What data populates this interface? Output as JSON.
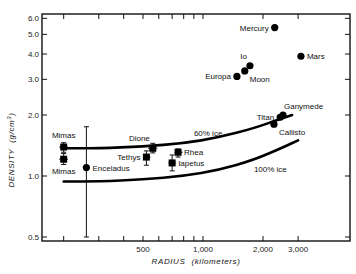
{
  "chart_data": {
    "type": "scatter",
    "title": "",
    "xlabel": "RADIUS (kilometers)",
    "ylabel": "DENSITY (g/cm³)",
    "xscale": "log",
    "yscale": "log",
    "xlim": [
      140,
      4500
    ],
    "ylim": [
      0.48,
      6.6
    ],
    "x_ticks": [
      {
        "value": 200,
        "label": ""
      },
      {
        "value": 300,
        "label": ""
      },
      {
        "value": 400,
        "label": ""
      },
      {
        "value": 500,
        "label": "500"
      },
      {
        "value": 600,
        "label": ""
      },
      {
        "value": 700,
        "label": ""
      },
      {
        "value": 800,
        "label": ""
      },
      {
        "value": 900,
        "label": ""
      },
      {
        "value": 1000,
        "label": "1,000"
      },
      {
        "value": 2000,
        "label": "2,000"
      },
      {
        "value": 3000,
        "label": "3,000"
      }
    ],
    "y_ticks": [
      {
        "value": 0.5,
        "label": "0.5"
      },
      {
        "value": 1.0,
        "label": "1.0"
      },
      {
        "value": 2.0,
        "label": "2.0"
      },
      {
        "value": 3.0,
        "label": "3.0"
      },
      {
        "value": 4.0,
        "label": "4.0"
      },
      {
        "value": 5.0,
        "label": "5.0"
      },
      {
        "value": 6.0,
        "label": "6.0"
      }
    ],
    "grid": false,
    "points": [
      {
        "name": "Mercury",
        "x": 2290,
        "y": 5.4,
        "marker": "circle",
        "label_side": "left"
      },
      {
        "name": "Mars",
        "x": 3100,
        "y": 3.9,
        "marker": "circle",
        "label_side": "right"
      },
      {
        "name": "Io",
        "x": 1720,
        "y": 3.5,
        "marker": "circle",
        "label_side": "above-left"
      },
      {
        "name": "Moon",
        "x": 1620,
        "y": 3.3,
        "marker": "circle",
        "label_side": "below-right"
      },
      {
        "name": "Europa",
        "x": 1480,
        "y": 3.1,
        "marker": "circle",
        "label_side": "left"
      },
      {
        "name": "Ganymede",
        "x": 2520,
        "y": 2.0,
        "marker": "circle",
        "label_side": "above-right"
      },
      {
        "name": "Titan",
        "x": 2440,
        "y": 1.95,
        "marker": "circle",
        "label_side": "left"
      },
      {
        "name": "Callisto",
        "x": 2270,
        "y": 1.8,
        "marker": "circle",
        "label_side": "below-right"
      },
      {
        "name": "Dione",
        "x": 560,
        "y": 1.37,
        "marker": "square",
        "err_y": [
          1.3,
          1.45
        ],
        "err_x": [
          530,
          590
        ],
        "label_side": "above-left"
      },
      {
        "name": "Rhea",
        "x": 750,
        "y": 1.31,
        "marker": "square",
        "err_y": [
          1.24,
          1.36
        ],
        "err_x": [
          720,
          790
        ],
        "label_side": "right"
      },
      {
        "name": "Tethys",
        "x": 520,
        "y": 1.24,
        "marker": "square",
        "err_y": [
          1.13,
          1.33
        ],
        "err_x": [
          500,
          545
        ],
        "label_side": "left"
      },
      {
        "name": "Iapetus",
        "x": 700,
        "y": 1.16,
        "marker": "square",
        "err_y": [
          1.06,
          1.27
        ],
        "err_x": [
          670,
          730
        ],
        "label_side": "right"
      },
      {
        "name": "Mimas",
        "x": 200,
        "y": 1.39,
        "marker": "square",
        "err_y": [
          1.31,
          1.46
        ],
        "err_x": [
          190,
          210
        ],
        "label_side": "above"
      },
      {
        "name": "Mimas",
        "x": 200,
        "y": 1.21,
        "marker": "square",
        "err_y": [
          1.14,
          1.29
        ],
        "err_x": [
          190,
          210
        ],
        "label_side": "below"
      },
      {
        "name": "Enceladus",
        "x": 260,
        "y": 1.1,
        "marker": "circle",
        "err_y": [
          0.5,
          1.75
        ],
        "label_side": "right"
      }
    ],
    "series": [
      {
        "name": "60% ice",
        "type": "line",
        "x": [
          200,
          300,
          500,
          800,
          1200,
          1800,
          2400,
          2800
        ],
        "y": [
          1.37,
          1.37,
          1.4,
          1.45,
          1.55,
          1.72,
          1.9,
          2.0
        ]
      },
      {
        "name": "100% ice",
        "type": "line",
        "x": [
          200,
          300,
          500,
          800,
          1200,
          1800,
          2500,
          3000
        ],
        "y": [
          0.94,
          0.94,
          0.96,
          1.0,
          1.07,
          1.2,
          1.38,
          1.5
        ]
      }
    ],
    "annotations": [
      {
        "text": "60% ice",
        "x": 900,
        "y": 1.57
      },
      {
        "text": "100% ice",
        "x": 1800,
        "y": 1.05
      }
    ],
    "legend": null
  },
  "labels": {
    "xlabel_main": "RADIUS",
    "xlabel_unit": "(kilometers)",
    "ylabel_main": "DENSITY",
    "ylabel_unit": "(g/cm",
    "ylabel_sup": "3",
    "ylabel_close": ")"
  }
}
